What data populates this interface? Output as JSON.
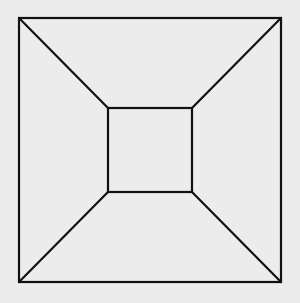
{
  "diagram": {
    "title": "",
    "colors": {
      "background": "#ececec",
      "stroke": "#111111"
    },
    "stroke_width": 2.2,
    "outer_square": {
      "x1": 19,
      "y1": 18,
      "x2": 281,
      "y2": 282
    },
    "inner_square": {
      "x1": 108,
      "y1": 108,
      "x2": 192,
      "y2": 192
    },
    "connectors": [
      {
        "name": "top-left",
        "from": [
          19,
          18
        ],
        "to": [
          108,
          108
        ]
      },
      {
        "name": "top-right",
        "from": [
          281,
          18
        ],
        "to": [
          192,
          108
        ]
      },
      {
        "name": "bottom-right",
        "from": [
          281,
          282
        ],
        "to": [
          192,
          192
        ]
      },
      {
        "name": "bottom-left",
        "from": [
          19,
          282
        ],
        "to": [
          108,
          192
        ]
      }
    ]
  }
}
